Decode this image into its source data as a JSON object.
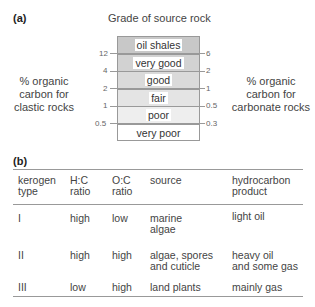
{
  "part_a": {
    "label": "(a)",
    "title": "Grade of source rock",
    "left_axis_label": [
      "% organic",
      "carbon for",
      "clastic rocks"
    ],
    "right_axis_label": [
      "% organic",
      "carbon for",
      "carbonate rocks"
    ],
    "grades": [
      "oil shales",
      "very good",
      "good",
      "fair",
      "poor",
      "very poor"
    ],
    "band_colors": [
      "#c8c8c8",
      "#d2d2d2",
      "#dadada",
      "#e4e4e4",
      "#eeeeee",
      "#ffffff"
    ],
    "left_ticks": [
      "12",
      "4",
      "2",
      "1",
      "0.5"
    ],
    "right_ticks": [
      "6",
      "2",
      "1",
      "0.5",
      "0.3"
    ]
  },
  "part_b": {
    "label": "(b)",
    "headers": [
      [
        "kerogen",
        "type"
      ],
      [
        "H:C",
        "ratio"
      ],
      [
        "O:C",
        "ratio"
      ],
      [
        "source",
        ""
      ],
      [
        "hydrocarbon",
        "product"
      ]
    ],
    "rows": [
      {
        "type": "I",
        "hc": "high",
        "oc": "low",
        "source": [
          "marine",
          "algae"
        ],
        "product": [
          "light oil",
          ""
        ]
      },
      {
        "type": "II",
        "hc": "high",
        "oc": "high",
        "source": [
          "algae, spores",
          "and cuticle"
        ],
        "product": [
          "heavy oil",
          "and some gas"
        ]
      },
      {
        "type": "III",
        "hc": "low",
        "oc": "high",
        "source": [
          "land plants",
          ""
        ],
        "product": [
          "mainly gas",
          ""
        ]
      }
    ]
  }
}
